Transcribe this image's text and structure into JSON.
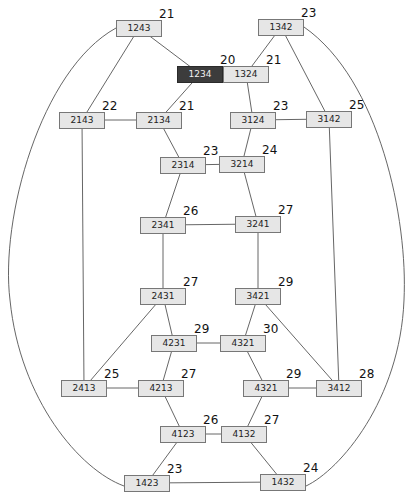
{
  "diagram": {
    "type": "permutation-graph",
    "nodes": [
      {
        "id": "n1243",
        "label": "1243",
        "score": "21",
        "x": 139,
        "y": 28,
        "highlight": false
      },
      {
        "id": "n1342",
        "label": "1342",
        "score": "23",
        "x": 281,
        "y": 27,
        "highlight": false
      },
      {
        "id": "n1234",
        "label": "1234",
        "score": "20",
        "x": 200,
        "y": 74,
        "highlight": true
      },
      {
        "id": "n1324",
        "label": "1324",
        "score": "21",
        "x": 246,
        "y": 74,
        "highlight": false
      },
      {
        "id": "n2143",
        "label": "2143",
        "score": "22",
        "x": 82,
        "y": 120,
        "highlight": false
      },
      {
        "id": "n2134",
        "label": "2134",
        "score": "21",
        "x": 159,
        "y": 120,
        "highlight": false
      },
      {
        "id": "n3124",
        "label": "3124",
        "score": "23",
        "x": 253,
        "y": 120,
        "highlight": false
      },
      {
        "id": "n3142",
        "label": "3142",
        "score": "25",
        "x": 329,
        "y": 119,
        "highlight": false
      },
      {
        "id": "n2314",
        "label": "2314",
        "score": "23",
        "x": 183,
        "y": 165,
        "highlight": false
      },
      {
        "id": "n3214",
        "label": "3214",
        "score": "24",
        "x": 242,
        "y": 164,
        "highlight": false
      },
      {
        "id": "n2341",
        "label": "2341",
        "score": "26",
        "x": 163,
        "y": 225,
        "highlight": false
      },
      {
        "id": "n3241",
        "label": "3241",
        "score": "27",
        "x": 258,
        "y": 224,
        "highlight": false
      },
      {
        "id": "n2431",
        "label": "2431",
        "score": "27",
        "x": 163,
        "y": 296,
        "highlight": false
      },
      {
        "id": "n3421",
        "label": "3421",
        "score": "29",
        "x": 258,
        "y": 296,
        "highlight": false
      },
      {
        "id": "n4231",
        "label": "4231",
        "score": "29",
        "x": 174,
        "y": 343,
        "highlight": false
      },
      {
        "id": "n4321a",
        "label": "4321",
        "score": "30",
        "x": 243,
        "y": 343,
        "highlight": false
      },
      {
        "id": "n2413",
        "label": "2413",
        "score": "25",
        "x": 84,
        "y": 388,
        "highlight": false
      },
      {
        "id": "n4213",
        "label": "4213",
        "score": "27",
        "x": 161,
        "y": 388,
        "highlight": false
      },
      {
        "id": "n4321b",
        "label": "4321",
        "score": "29",
        "x": 266,
        "y": 388,
        "highlight": false
      },
      {
        "id": "n3412",
        "label": "3412",
        "score": "28",
        "x": 339,
        "y": 388,
        "highlight": false
      },
      {
        "id": "n4123",
        "label": "4123",
        "score": "26",
        "x": 183,
        "y": 434,
        "highlight": false
      },
      {
        "id": "n4132",
        "label": "4132",
        "score": "27",
        "x": 244,
        "y": 434,
        "highlight": false
      },
      {
        "id": "n1423",
        "label": "1423",
        "score": "23",
        "x": 147,
        "y": 483,
        "highlight": false
      },
      {
        "id": "n1432",
        "label": "1432",
        "score": "24",
        "x": 283,
        "y": 482,
        "highlight": false
      }
    ],
    "edges": [
      [
        "n1243",
        "n1234"
      ],
      [
        "n1243",
        "n2143"
      ],
      [
        "n1342",
        "n1324"
      ],
      [
        "n1342",
        "n3142"
      ],
      [
        "n1234",
        "n1324"
      ],
      [
        "n1234",
        "n2134"
      ],
      [
        "n1324",
        "n3124"
      ],
      [
        "n2143",
        "n2134"
      ],
      [
        "n2143",
        "n2413"
      ],
      [
        "n2134",
        "n2314"
      ],
      [
        "n3124",
        "n3142"
      ],
      [
        "n3124",
        "n3214"
      ],
      [
        "n3142",
        "n3412"
      ],
      [
        "n2314",
        "n3214"
      ],
      [
        "n2314",
        "n2341"
      ],
      [
        "n3214",
        "n3241"
      ],
      [
        "n2341",
        "n3241"
      ],
      [
        "n2341",
        "n2431"
      ],
      [
        "n3241",
        "n3421"
      ],
      [
        "n2431",
        "n4231"
      ],
      [
        "n2431",
        "n2413"
      ],
      [
        "n3421",
        "n4321a"
      ],
      [
        "n3421",
        "n3412"
      ],
      [
        "n4231",
        "n4321a"
      ],
      [
        "n4231",
        "n4213"
      ],
      [
        "n4321a",
        "n4321b"
      ],
      [
        "n2413",
        "n4213"
      ],
      [
        "n4213",
        "n4123"
      ],
      [
        "n4321b",
        "n3412"
      ],
      [
        "n4321b",
        "n4132"
      ],
      [
        "n4123",
        "n4132"
      ],
      [
        "n4123",
        "n1423"
      ],
      [
        "n4132",
        "n1432"
      ],
      [
        "n1423",
        "n1432"
      ]
    ],
    "arcs": [
      {
        "from": "n1243",
        "to": "n1423",
        "side": "left",
        "path": "M116 28 C 40 70, 0 220, 10 300 C 20 400, 80 470, 124 486"
      },
      {
        "from": "n1342",
        "to": "n1432",
        "side": "right",
        "path": "M304 27 C 380 80, 408 220, 404 300 C 400 400, 340 470, 306 486"
      }
    ],
    "colors": {
      "node_fill": "#e6e6e6",
      "node_border": "#777777",
      "highlight_fill": "#3c3c3c",
      "highlight_text": "#f0f0f0",
      "edge": "#555555"
    }
  }
}
